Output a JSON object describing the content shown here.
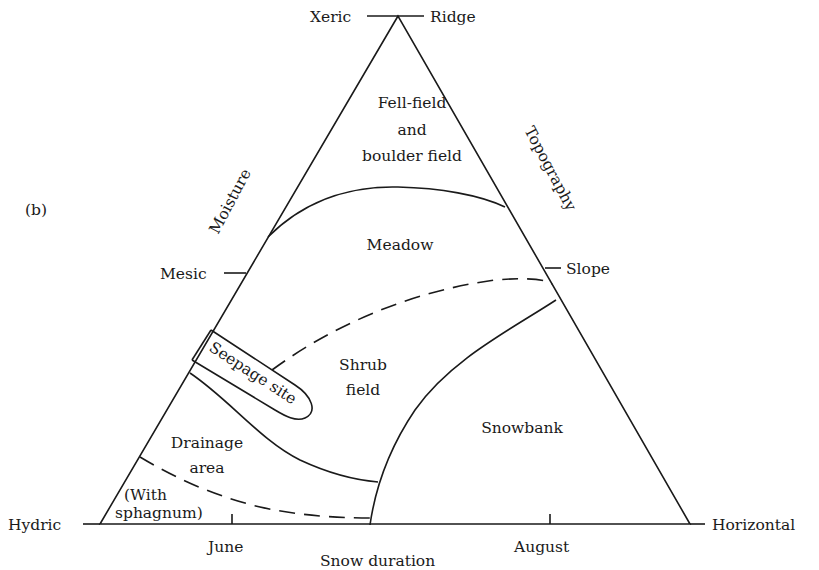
{
  "figure_label": "(b)",
  "axes": {
    "moisture": {
      "title": "Moisture",
      "ticks": [
        "Xeric",
        "Mesic",
        "Hydric"
      ]
    },
    "topography": {
      "title": "Topography",
      "ticks": [
        "Ridge",
        "Slope",
        "Horizontal"
      ]
    },
    "snow_duration": {
      "title": "Snow duration",
      "ticks": [
        "June",
        "August"
      ]
    }
  },
  "regions": {
    "fell_field": [
      "Fell-field",
      "and",
      "boulder field"
    ],
    "meadow": "Meadow",
    "seepage": "Seepage site",
    "shrub": [
      "Shrub",
      "field"
    ],
    "snowbank": "Snowbank",
    "drainage": [
      "Drainage",
      "area"
    ],
    "sphagnum": [
      "(With",
      "sphagnum)"
    ]
  },
  "colors": {
    "ink": "#1a1a1a",
    "background": "#ffffff"
  }
}
